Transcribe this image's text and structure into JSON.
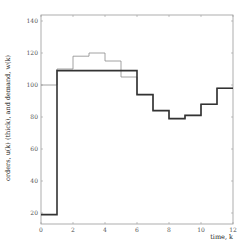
{
  "chart_data": {
    "type": "line",
    "subtype": "step",
    "title": "",
    "xlabel": "time, k",
    "ylabel": "orders, u(k) (thick), and demand, w(k)",
    "xlim": [
      0,
      12
    ],
    "ylim": [
      13,
      143
    ],
    "xticks": [
      0,
      2,
      4,
      6,
      8,
      10,
      12
    ],
    "yticks": [
      20,
      40,
      60,
      80,
      100,
      120,
      140
    ],
    "grid": false,
    "legend": null,
    "x": [
      0,
      1,
      2,
      3,
      4,
      5,
      6,
      7,
      8,
      9,
      10,
      11
    ],
    "series": [
      {
        "name": "demand, w(k)",
        "style": "thin",
        "color": "#8a8a8a",
        "values": [
          100,
          110,
          118,
          120,
          115,
          105,
          94,
          84,
          79,
          81,
          88,
          98
        ]
      },
      {
        "name": "orders, u(k)",
        "style": "thick",
        "color": "#333333",
        "values": [
          19,
          109,
          109,
          109,
          109,
          109,
          94,
          84,
          79,
          81,
          88,
          98
        ]
      }
    ]
  }
}
